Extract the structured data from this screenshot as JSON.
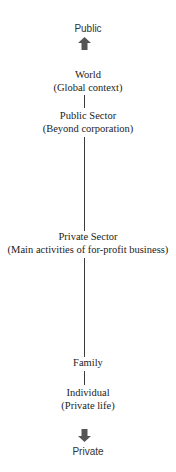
{
  "diagram": {
    "top_label": "Public",
    "bottom_label": "Private",
    "arrow_color": "#555555",
    "line_color": "#3a3a3a",
    "nodes": [
      {
        "title": "World",
        "subtitle": "(Global context)"
      },
      {
        "title": "Public Sector",
        "subtitle": "(Beyond corporation)"
      },
      {
        "title": "Private Sector",
        "subtitle": "(Main activities of for-profit business)"
      },
      {
        "title": "Family",
        "subtitle": ""
      },
      {
        "title": "Individual",
        "subtitle": "(Private life)"
      }
    ],
    "icons": {
      "up": "arrow-up-icon",
      "down": "arrow-down-icon"
    }
  }
}
